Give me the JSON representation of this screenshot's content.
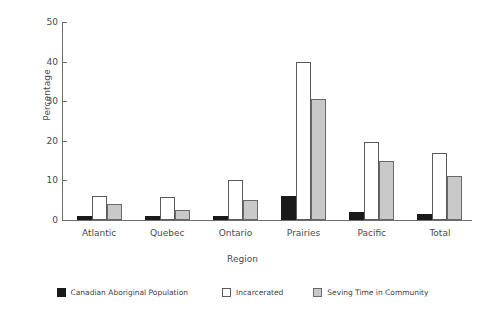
{
  "chart_data": {
    "type": "bar",
    "title": "",
    "xlabel": "Region",
    "ylabel": "Percentage",
    "categories": [
      "Atlantic",
      "Quebec",
      "Ontario",
      "Prairies",
      "Pacific",
      "Total"
    ],
    "series": [
      {
        "name": "Canadian Aboriginal Population",
        "color": "#1a1a1a",
        "values": [
          1.0,
          1.0,
          1.0,
          6.0,
          2.0,
          1.5
        ]
      },
      {
        "name": "Incarcerated",
        "color": "#ffffff",
        "values": [
          6.0,
          5.8,
          10.0,
          39.8,
          19.7,
          17.0
        ]
      },
      {
        "name": "Seving Time in Community",
        "color": "#c9c9c9",
        "values": [
          4.0,
          2.5,
          5.0,
          30.5,
          15.0,
          11.0
        ]
      }
    ],
    "ylim": [
      0,
      50
    ],
    "yticks": [
      0,
      10,
      20,
      30,
      40,
      50
    ],
    "grid": false,
    "legend_position": "bottom"
  }
}
